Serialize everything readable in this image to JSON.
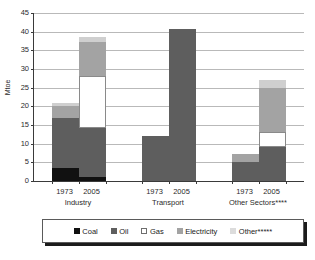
{
  "chart_data": {
    "type": "bar",
    "stacked": true,
    "title": "",
    "subtitle": "",
    "xlabel": "",
    "ylabel": "Mtoe",
    "ylim": [
      0,
      45
    ],
    "y_ticks": [
      0,
      5,
      10,
      15,
      20,
      25,
      30,
      35,
      40,
      45
    ],
    "grid": true,
    "legend_position": "bottom",
    "groups": [
      {
        "name": "Industry",
        "years": [
          "1973",
          "2005"
        ]
      },
      {
        "name": "Transport",
        "years": [
          "1973",
          "2005"
        ]
      },
      {
        "name": "Other Sectors****",
        "years": [
          "1973",
          "2005"
        ]
      }
    ],
    "categories": [
      "Industry 1973",
      "Industry 2005",
      "Transport 1973",
      "Transport 2005",
      "Other Sectors 1973",
      "Other Sectors 2005"
    ],
    "series": [
      {
        "name": "Coal",
        "color": "#111111",
        "values": [
          3.5,
          1.1,
          0.0,
          0.0,
          0.0,
          0.0
        ]
      },
      {
        "name": "Oil",
        "color": "#5e5e5e",
        "values": [
          13.5,
          13.2,
          12.0,
          40.6,
          5.0,
          9.0
        ]
      },
      {
        "name": "Gas",
        "color": "#ffffff",
        "values": [
          0.0,
          13.7,
          0.0,
          0.0,
          0.0,
          4.2
        ]
      },
      {
        "name": "Electricity",
        "color": "#a3a3a3",
        "values": [
          3.0,
          9.3,
          0.0,
          0.0,
          2.2,
          11.8
        ]
      },
      {
        "name": "Other*****",
        "color": "#cfcfcf",
        "values": [
          0.8,
          1.4,
          0.0,
          0.0,
          0.0,
          2.1
        ]
      }
    ],
    "totals": [
      20.8,
      38.7,
      12.0,
      40.6,
      7.2,
      27.1
    ]
  },
  "axis": {
    "y_title": "Mtoe",
    "y_tick_labels": [
      "45",
      "40",
      "35",
      "30",
      "25",
      "20",
      "15",
      "10",
      "5",
      "0"
    ]
  },
  "legend": {
    "items": [
      {
        "label": "Coal",
        "swatch": "coal-swatch"
      },
      {
        "label": "Oil",
        "swatch": "oil-swatch"
      },
      {
        "label": "Gas",
        "swatch": "gas-swatch"
      },
      {
        "label": "Electricity",
        "swatch": "electricity-swatch"
      },
      {
        "label": "Other*****",
        "swatch": "other-swatch"
      }
    ]
  },
  "x_axis": {
    "year_labels": [
      "1973",
      "2005",
      "1973",
      "2005",
      "1973",
      "2005"
    ],
    "group_labels": [
      "Industry",
      "Transport",
      "Other Sectors****"
    ]
  }
}
